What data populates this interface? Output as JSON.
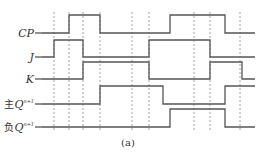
{
  "diagram": {
    "caption": "(a)",
    "dashed_lines_x": [
      54,
      69,
      83,
      100,
      132,
      149,
      194,
      210,
      240
    ],
    "dash_top": 12,
    "dash_bottom": 130,
    "x_start": 42,
    "x_end": 255,
    "signals": [
      {
        "id": "cp",
        "label": "CP",
        "label_x": 34,
        "y_low": 33,
        "y_high": 15,
        "initial": 0,
        "edges": [
          69,
          100,
          170,
          225
        ]
      },
      {
        "id": "j",
        "label": "J",
        "label_x": 34,
        "y_low": 57,
        "y_high": 40,
        "initial": 0,
        "edges": [
          54,
          83,
          149,
          210
        ]
      },
      {
        "id": "k",
        "label": "K",
        "label_x": 34,
        "y_low": 79,
        "y_high": 62,
        "initial": 0,
        "edges": [
          83,
          149,
          210,
          242
        ]
      },
      {
        "id": "master-q",
        "label_prefix": "主",
        "label": "Q",
        "label_sup": "n+1",
        "label_x": 34,
        "y_low": 104,
        "y_high": 86,
        "initial": 0,
        "edges": [
          100,
          163,
          225
        ]
      },
      {
        "id": "slave-q",
        "label_prefix": "负",
        "label": "Q",
        "label_sup": "n+1",
        "label_x": 34,
        "y_low": 127,
        "y_high": 109,
        "initial": 0,
        "edges": [
          170,
          225
        ]
      }
    ]
  }
}
